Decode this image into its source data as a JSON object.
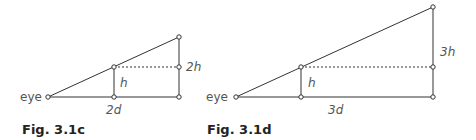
{
  "figures": [
    {
      "caption": "Fig. 3.1c",
      "eye_label": "eye",
      "inner_height_label": "h",
      "outer_height_label": "2h",
      "distance_label": "2d"
    },
    {
      "caption": "Fig. 3.1d",
      "eye_label": "eye",
      "inner_height_label": "h",
      "outer_height_label": "3h",
      "distance_label": "3d"
    }
  ],
  "colors": {
    "line": "#333333",
    "label": "#555555"
  }
}
